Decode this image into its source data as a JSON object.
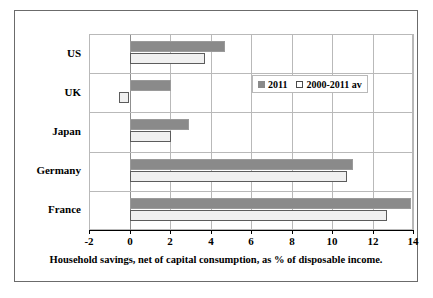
{
  "chart_data": {
    "type": "bar",
    "orientation": "horizontal",
    "title": "",
    "xlabel": "Household savings, net of capital consumption, as % of disposable income.",
    "ylabel": "",
    "categories": [
      "US",
      "UK",
      "Japan",
      "Germany",
      "France"
    ],
    "xlim": [
      -2,
      14
    ],
    "xticks": [
      "-2",
      "0",
      "2",
      "4",
      "6",
      "8",
      "10",
      "12",
      "14"
    ],
    "xtick_values": [
      -2,
      0,
      2,
      4,
      6,
      8,
      10,
      12,
      14
    ],
    "grid": true,
    "legend_position": "upper right inside plot",
    "series": [
      {
        "name": "2011",
        "color": "#8a8a8a",
        "values": [
          4.7,
          2.0,
          2.9,
          11.0,
          13.9
        ]
      },
      {
        "name": "2000-2011 av",
        "color": "#f0f0f0",
        "values": [
          3.7,
          -0.5,
          2.0,
          10.7,
          12.7
        ]
      }
    ]
  },
  "legend": {
    "items": [
      {
        "label": "2011",
        "swatch": "filled-gray-square"
      },
      {
        "label": "2000-2011 av",
        "swatch": "outlined-white-square"
      }
    ]
  }
}
